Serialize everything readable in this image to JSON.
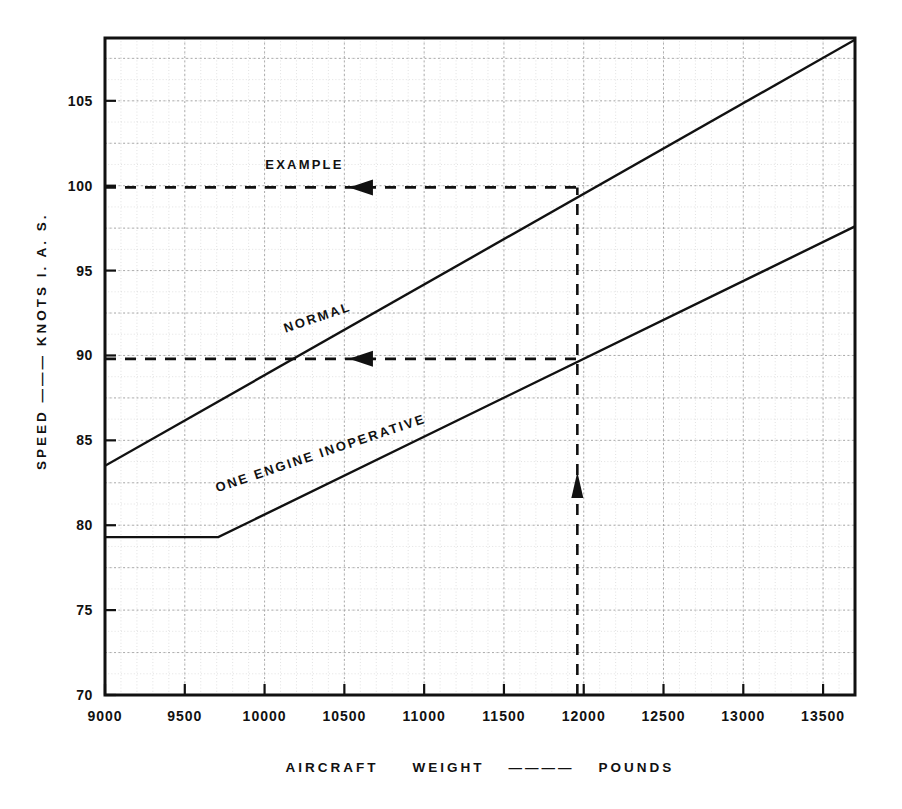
{
  "chart_data": {
    "type": "line",
    "title": "",
    "xlabel": "AIRCRAFT    WEIGHT    ———    POUNDS",
    "ylabel": "SPEED  ———  KNOTS      I. A. S.",
    "xlim": [
      9000,
      13700
    ],
    "ylim": [
      70,
      108.7
    ],
    "x_ticks": [
      9000,
      9500,
      10000,
      10500,
      11000,
      11500,
      12000,
      12500,
      13000,
      13500
    ],
    "x_tick_labels": [
      "9000",
      "9500",
      "10000",
      "10500",
      "11000",
      "11500",
      "12000",
      "12500",
      "13000",
      "13500"
    ],
    "y_ticks": [
      70,
      75,
      80,
      85,
      90,
      95,
      100,
      105
    ],
    "y_tick_labels": [
      "70",
      "75",
      "80",
      "85",
      "90",
      "95",
      "100",
      "105"
    ],
    "grid": true,
    "grid_minor_x_step": 100,
    "grid_minor_y_step": 1.25,
    "grid_major_x_step": 500,
    "grid_major_y_step": 2.5,
    "legend_position": "inline-on-curve",
    "series": [
      {
        "name": "NORMAL",
        "label": "NORMAL",
        "label_x": 10340,
        "label_y": 92.0,
        "label_rotation": -18.5,
        "points": [
          {
            "x": 9000,
            "y": 83.5
          },
          {
            "x": 13700,
            "y": 108.6
          }
        ]
      },
      {
        "name": "ONE ENGINE INOPERATIVE",
        "label": "ONE  ENGINE  INOPERATIVE",
        "label_x": 10360,
        "label_y": 84.0,
        "label_rotation": -18.5,
        "points": [
          {
            "x": 9000,
            "y": 79.3
          },
          {
            "x": 9710,
            "y": 79.3
          },
          {
            "x": 13700,
            "y": 97.6
          }
        ]
      }
    ],
    "annotations": [
      {
        "name": "example-label",
        "text": "EXAMPLE",
        "x": 10250,
        "y": 101.0
      },
      {
        "name": "example-vertical-line",
        "kind": "dashed-vertical-arrow",
        "x": 11960,
        "y_start": 70,
        "y_end": 99.9,
        "arrow_at_y": 82.2,
        "arrow_direction": "up"
      },
      {
        "name": "example-normal-horizontal-line",
        "kind": "dashed-horizontal-arrow",
        "y": 99.9,
        "x_start": 9000,
        "x_end": 11960,
        "arrow_at_x": 10610,
        "arrow_direction": "left",
        "reads": 100
      },
      {
        "name": "example-oei-horizontal-line",
        "kind": "dashed-horizontal-arrow",
        "y": 89.8,
        "x_start": 9000,
        "x_end": 11960,
        "arrow_at_x": 10610,
        "arrow_direction": "left",
        "reads": 90
      }
    ],
    "colors": {
      "ink": "#111111",
      "grid_major": "#9a9a9a",
      "grid_minor": "#cfcfcf",
      "background": "#ffffff"
    }
  }
}
